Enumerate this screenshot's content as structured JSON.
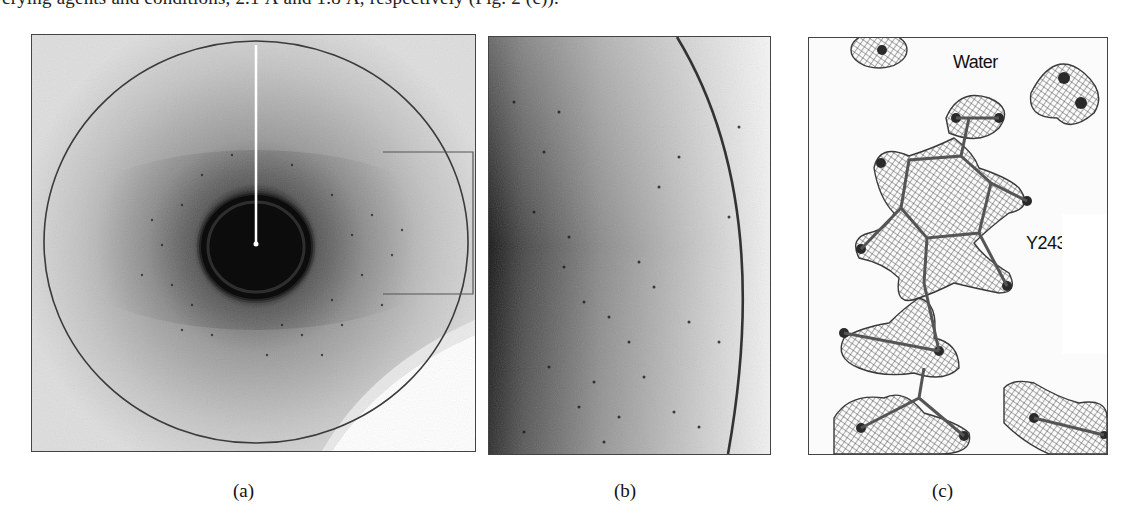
{
  "document": {
    "partial_text_line": "crying agents and conditions, 2.1 Å and 1.8 Å, respectively (Fig. 2 (c))."
  },
  "figure": {
    "panels": [
      {
        "id": "a",
        "caption": "(a)",
        "description": "X-ray diffraction image with resolution circle, beamstop and inset box",
        "colors": {
          "background": "#d8d8d8",
          "core": "#0a0a0a",
          "ring": "#333333"
        }
      },
      {
        "id": "b",
        "caption": "(b)",
        "description": "Magnified region of diffraction pattern showing spots and resolution arc"
      },
      {
        "id": "c",
        "caption": "(c)",
        "description": "Electron density mesh around tyrosine residue",
        "labels": {
          "water": "Water",
          "residue": "Y243"
        }
      }
    ]
  }
}
